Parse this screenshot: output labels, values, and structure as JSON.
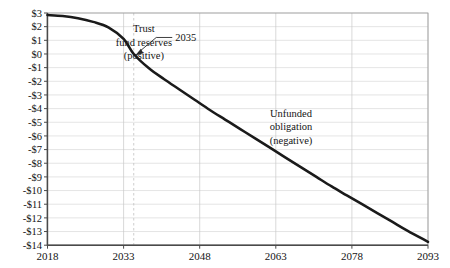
{
  "chart_data": {
    "type": "line",
    "title": "",
    "subtitle": "",
    "xlabel": "",
    "ylabel": "",
    "xlim": [
      2018,
      2093
    ],
    "ylim": [
      -14,
      3
    ],
    "grid": true,
    "legend_position": "none",
    "x_ticks": [
      "2018",
      "2033",
      "2048",
      "2063",
      "2078",
      "2093"
    ],
    "x_tick_values": [
      2018,
      2033,
      2048,
      2063,
      2078,
      2093
    ],
    "y_ticks": [
      "$3",
      "$2",
      "$1",
      "$0",
      "-$1",
      "-$2",
      "-$3",
      "-$4",
      "-$5",
      "-$6",
      "-$7",
      "-$8",
      "-$9",
      "-$10",
      "-$11",
      "-$12",
      "-$13",
      "-$14"
    ],
    "y_tick_values": [
      3,
      2,
      1,
      0,
      -1,
      -2,
      -3,
      -4,
      -5,
      -6,
      -7,
      -8,
      -9,
      -10,
      -11,
      -12,
      -13,
      -14
    ],
    "series": [
      {
        "name": "Social Security trust fund balance",
        "color": "#1a1a1a",
        "x": [
          2018,
          2021,
          2024,
          2027,
          2030,
          2033,
          2035,
          2038,
          2041,
          2044,
          2047,
          2050,
          2053,
          2056,
          2059,
          2062,
          2065,
          2068,
          2071,
          2074,
          2077,
          2080,
          2083,
          2086,
          2089,
          2093
        ],
        "y": [
          2.85,
          2.78,
          2.62,
          2.35,
          1.95,
          1.1,
          0.0,
          -1.05,
          -1.85,
          -2.6,
          -3.35,
          -4.1,
          -4.8,
          -5.5,
          -6.2,
          -6.9,
          -7.6,
          -8.3,
          -9.0,
          -9.7,
          -10.35,
          -11.0,
          -11.65,
          -12.3,
          -12.95,
          -13.75
        ]
      }
    ],
    "annotations": [
      {
        "id": "trust-fund-reserves",
        "lines": [
          "Trust",
          "fund reserves",
          "(positive)"
        ],
        "x": 2037,
        "y": 1.6
      },
      {
        "id": "unfunded-obligation",
        "lines": [
          "Unfunded",
          "obligation",
          "(negative)"
        ],
        "x": 2066,
        "y": -4.6
      },
      {
        "id": "crossover-year",
        "label": "2035",
        "x": 2035,
        "y": 0.0,
        "marker": "dashed-vertical"
      }
    ]
  }
}
